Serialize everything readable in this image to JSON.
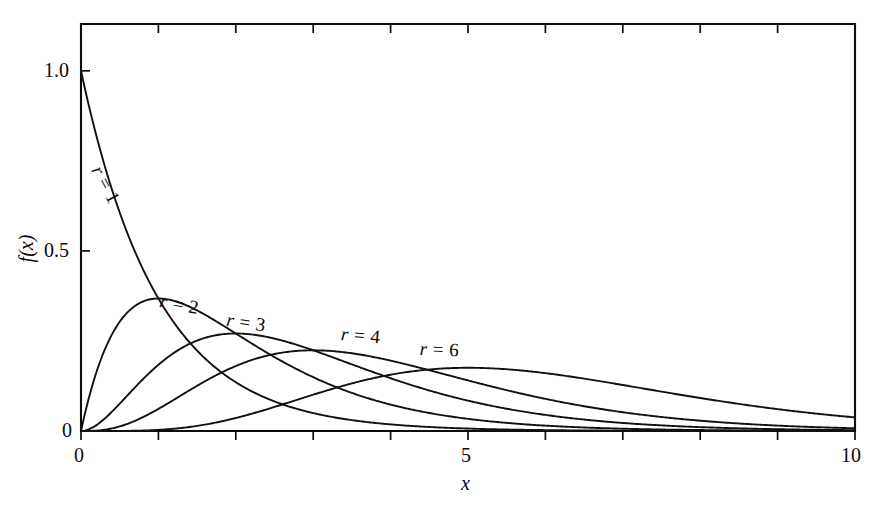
{
  "chart_data": {
    "type": "line",
    "title": "",
    "subtitle": "",
    "xlabel": "x",
    "ylabel": "f(x)",
    "xlim": [
      0,
      10
    ],
    "ylim": [
      0,
      1.13
    ],
    "grid": false,
    "legend_position": "inline-curve-labels",
    "x_ticks_labeled": [
      "0",
      "5",
      "10"
    ],
    "x_tick_values_labeled": [
      0,
      5,
      10
    ],
    "x_tick_values_all": [
      0,
      1,
      2,
      3,
      4,
      5,
      6,
      7,
      8,
      9,
      10
    ],
    "y_ticks_labeled": [
      "0",
      "0.5",
      "1.0"
    ],
    "y_tick_values_labeled": [
      0,
      0.5,
      1.0
    ],
    "series": [
      {
        "name": "r = 1",
        "label": "r = 1",
        "r": 1,
        "lambda": 1,
        "peak_x": 0,
        "peak_y": 1.0,
        "x": [
          0,
          0.25,
          0.5,
          0.75,
          1,
          1.25,
          1.5,
          1.75,
          2,
          2.5,
          3,
          3.5,
          4,
          4.5,
          5,
          6,
          7,
          8,
          9,
          10
        ],
        "values": [
          1.0,
          0.7788,
          0.6065,
          0.4724,
          0.3679,
          0.2865,
          0.2231,
          0.1738,
          0.1353,
          0.0821,
          0.0498,
          0.0302,
          0.0183,
          0.0111,
          0.0067,
          0.0025,
          0.0009,
          0.0003,
          0.0001,
          0.0
        ]
      },
      {
        "name": "r = 2",
        "label": "r = 2",
        "r": 2,
        "lambda": 1,
        "peak_x": 1,
        "peak_y": 0.3679,
        "x": [
          0,
          0.25,
          0.5,
          0.75,
          1,
          1.25,
          1.5,
          1.75,
          2,
          2.5,
          3,
          3.5,
          4,
          4.5,
          5,
          6,
          7,
          8,
          9,
          10
        ],
        "values": [
          0.0,
          0.1947,
          0.3033,
          0.3543,
          0.3679,
          0.3581,
          0.3347,
          0.3041,
          0.2707,
          0.2052,
          0.1494,
          0.1057,
          0.0733,
          0.05,
          0.0337,
          0.0149,
          0.0064,
          0.0027,
          0.0011,
          0.0005
        ]
      },
      {
        "name": "r = 3",
        "label": "r = 3",
        "r": 3,
        "lambda": 1,
        "peak_x": 2,
        "peak_y": 0.2707,
        "x": [
          0,
          0.5,
          1,
          1.5,
          2,
          2.5,
          3,
          3.5,
          4,
          4.5,
          5,
          6,
          7,
          8,
          9,
          10
        ],
        "values": [
          0.0,
          0.0758,
          0.1839,
          0.251,
          0.2707,
          0.2565,
          0.224,
          0.185,
          0.1465,
          0.1125,
          0.0842,
          0.0446,
          0.0223,
          0.0107,
          0.005,
          0.0023
        ]
      },
      {
        "name": "r = 4",
        "label": "r = 4",
        "r": 4,
        "lambda": 1,
        "peak_x": 3,
        "peak_y": 0.224,
        "x": [
          0,
          0.5,
          1,
          1.5,
          2,
          2.5,
          3,
          3.5,
          4,
          4.5,
          5,
          6,
          7,
          8,
          9,
          10
        ],
        "values": [
          0.0,
          0.0126,
          0.0613,
          0.1255,
          0.1804,
          0.2138,
          0.224,
          0.2158,
          0.1954,
          0.1687,
          0.1404,
          0.0892,
          0.0521,
          0.0286,
          0.015,
          0.0076
        ]
      },
      {
        "name": "r = 6",
        "label": "r = 6",
        "r": 6,
        "lambda": 1,
        "peak_x": 5,
        "peak_y": 0.1755,
        "x": [
          0,
          0.5,
          1,
          1.5,
          2,
          2.5,
          3,
          3.5,
          4,
          4.5,
          5,
          5.5,
          6,
          7,
          8,
          9,
          10
        ],
        "values": [
          0.0,
          0.0002,
          0.0031,
          0.0141,
          0.0361,
          0.0668,
          0.1008,
          0.1321,
          0.1563,
          0.1708,
          0.1755,
          0.1714,
          0.1606,
          0.1277,
          0.0916,
          0.0607,
          0.0378
        ]
      }
    ]
  },
  "axes": {
    "y_label": "f(x)",
    "x_label": "x",
    "y_tick_labels": [
      {
        "text": "1.0",
        "value": 1.0
      },
      {
        "text": "0.5",
        "value": 0.5
      },
      {
        "text": "0",
        "value": 0
      }
    ],
    "x_tick_labels": [
      {
        "text": "0",
        "value": 0
      },
      {
        "text": "5",
        "value": 5
      },
      {
        "text": "10",
        "value": 10
      }
    ]
  },
  "curve_labels": [
    {
      "text_var": "r",
      "text_rest": "= 1",
      "series": "r = 1"
    },
    {
      "text_var": "r",
      "text_rest": "= 2",
      "series": "r = 2"
    },
    {
      "text_var": "r",
      "text_rest": "= 3",
      "series": "r = 3"
    },
    {
      "text_var": "r",
      "text_rest": "= 4",
      "series": "r = 4"
    },
    {
      "text_var": "r",
      "text_rest": "= 6",
      "series": "r = 6"
    }
  ],
  "colors": {
    "curve": "#111111",
    "axis": "#0d0d0d",
    "background": "#ffffff",
    "text": "#0b0b0b"
  }
}
